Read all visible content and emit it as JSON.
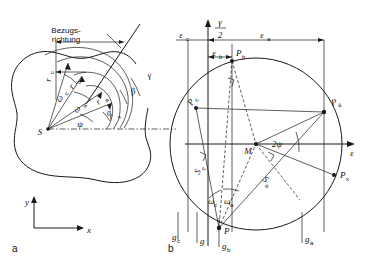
{
  "figure": {
    "title_text": "",
    "panels": [
      {
        "tag": "a",
        "name": "left-panel-body-contour"
      },
      {
        "tag": "b",
        "name": "right-panel-mohr-circle"
      }
    ],
    "colors": {
      "ink": "#1a1a1a",
      "background": "#ffffff"
    }
  },
  "left_panel": {
    "tag": "a",
    "reference_direction_label_line1": "Bezugs-",
    "reference_direction_label_line2": "richtung",
    "center_point_label": "S",
    "radii": [
      {
        "name": "r-c",
        "label": "r",
        "sub": "c"
      },
      {
        "name": "r-b",
        "label": "r",
        "sub": "b"
      },
      {
        "name": "r-a",
        "label": "r",
        "sub": "a"
      },
      {
        "name": "r-x",
        "label": "r",
        "sub": "x"
      }
    ],
    "angles": [
      {
        "name": "omega-c",
        "label": "ω",
        "sub": "c"
      },
      {
        "name": "omega-a",
        "label": "ω",
        "sub": "a"
      },
      {
        "name": "psi",
        "label": "ψ",
        "sub": ""
      },
      {
        "name": "alpha",
        "label": "α",
        "sub": ""
      },
      {
        "name": "beta",
        "label": "β",
        "sub": ""
      },
      {
        "name": "gamma",
        "label": "γ",
        "sub": ""
      }
    ],
    "axes": {
      "x_label": "x",
      "y_label": "y"
    }
  },
  "right_panel": {
    "tag": "b",
    "vertical_axis_label_numerator": "γ",
    "vertical_axis_label_denominator": "2",
    "horizontal_axis_label": "ε",
    "center_label": "M",
    "top_dimension_labels": [
      {
        "name": "epsilon-c",
        "label": "ε",
        "sub": "c"
      },
      {
        "name": "epsilon-b",
        "label": "ε",
        "sub": "b"
      },
      {
        "name": "epsilon-a",
        "label": "ε",
        "sub": "a"
      }
    ],
    "bottom_dimension_labels": [
      {
        "name": "g-c",
        "label": "g",
        "sub": "c"
      },
      {
        "name": "g",
        "label": "g",
        "sub": ""
      },
      {
        "name": "g-b",
        "label": "g",
        "sub": "b"
      },
      {
        "name": "g-a",
        "label": "g",
        "sub": "a"
      }
    ],
    "circle_points": [
      {
        "name": "point-pc",
        "label": "P",
        "sub": "c"
      },
      {
        "name": "point-pb",
        "label": "P",
        "sub": "b"
      },
      {
        "name": "point-pa",
        "label": "P",
        "sub": "a"
      },
      {
        "name": "point-px",
        "label": "P",
        "sub": "x"
      },
      {
        "name": "point-p",
        "label": "P",
        "sub": ""
      }
    ],
    "chord_labels": [
      {
        "name": "s-c",
        "label": "S",
        "sub": "c"
      },
      {
        "name": "s-a",
        "label": "S",
        "sub": "a"
      }
    ],
    "angles": [
      {
        "name": "two-psi",
        "label": "2ψ",
        "sub": ""
      },
      {
        "name": "omega-c",
        "label": "ω",
        "sub": "c"
      },
      {
        "name": "omega-a",
        "label": "ω",
        "sub": "a"
      }
    ]
  }
}
